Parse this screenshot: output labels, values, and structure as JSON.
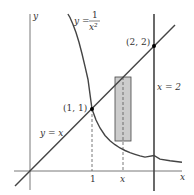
{
  "figure": {
    "axes": {
      "x_label": "x",
      "y_label": "y"
    },
    "curves": {
      "hyperbola_label_lhs": "y =",
      "hyperbola_num": "1",
      "hyperbola_den": "x²",
      "line_label": "y = x",
      "vertical_label": "x = 2"
    },
    "points": {
      "p1": "(1, 1)",
      "p2": "(2, 2)"
    },
    "ticks": {
      "one": "1",
      "x": "x"
    },
    "colors": {
      "curve": "#444444",
      "rect_fill": "#cccccc",
      "point": "#000000"
    }
  }
}
